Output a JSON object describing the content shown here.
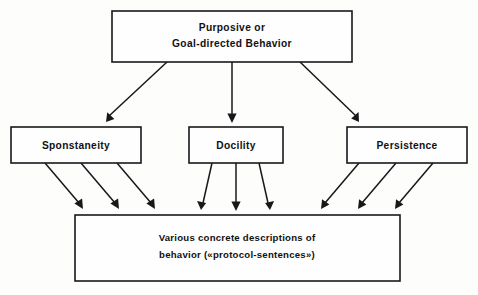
{
  "diagram": {
    "background_color": "#fdfdfc",
    "stroke_color": "#17181a",
    "box_fill_color": "#fefefe",
    "nodes": {
      "root": {
        "id": "purposive-behavior",
        "line1": "Purposive  or",
        "line2": "Goal-directed  Behavior"
      },
      "middle": [
        {
          "id": "sponstaneity",
          "label": "Sponstaneity"
        },
        {
          "id": "docility",
          "label": "Docility"
        },
        {
          "id": "persistence",
          "label": "Persistence"
        }
      ],
      "bottom": {
        "id": "concrete-descriptions",
        "line1": "Various  concrete  descriptions  of",
        "line2": "behavior  («protocol-sentences»)"
      }
    },
    "edges": {
      "root_to_middle_count": 3,
      "sponstaneity_to_bottom_count": 3,
      "docility_to_bottom_count": 3,
      "persistence_to_bottom_count": 3,
      "arrow_direction": "downward"
    }
  }
}
